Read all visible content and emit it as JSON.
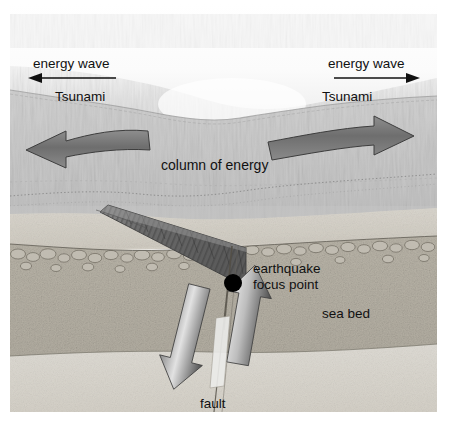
{
  "figure": {
    "width": 451,
    "height": 439,
    "background_color": "#ffffff"
  },
  "labels": {
    "energy_wave_left": "energy wave",
    "energy_wave_right": "energy wave",
    "tsunami_left": "Tsunami",
    "tsunami_right": "Tsunami",
    "column_of_energy": "column of energy",
    "earthquake_line1": "earthquake",
    "earthquake_line2": "focus point",
    "sea_bed": "sea bed",
    "fault": "fault"
  },
  "colors": {
    "sky": "#fafafa",
    "sea_surface_haze": "#ededed",
    "water_column": "#c9c9c9",
    "water_deep": "#c2c2c2",
    "sediment_light": "#d6d2c9",
    "sea_bed": "#b7b2a6",
    "bedrock": "#d9d6cf",
    "slab_dark": "#6f6f6f",
    "arrow_dark": "#5d5d5d",
    "arrow_light": "#d8d8d8",
    "focus_point": "#000000",
    "label_text": "#111111",
    "fault_line": "#6b6b6b"
  },
  "elements": {
    "tsunami_arrow_left": {
      "name": "left-pointing thin arrow",
      "direction": "left"
    },
    "tsunami_arrow_right": {
      "name": "right-pointing thin arrow",
      "direction": "right"
    },
    "energy_block_arrow_left": {
      "name": "large curved block arrow in water column",
      "direction": "left"
    },
    "energy_block_arrow_right": {
      "name": "large curved block arrow in water column",
      "direction": "right"
    },
    "fault_arrow_down": {
      "name": "downthrown block motion arrow",
      "direction": "down-left"
    },
    "fault_arrow_up": {
      "name": "upthrown block motion arrow",
      "direction": "up-right"
    },
    "subducting_slab": {
      "name": "striated descending plate wedge"
    },
    "focus_point_marker": {
      "name": "earthquake focus point dot",
      "shape": "filled circle"
    }
  }
}
